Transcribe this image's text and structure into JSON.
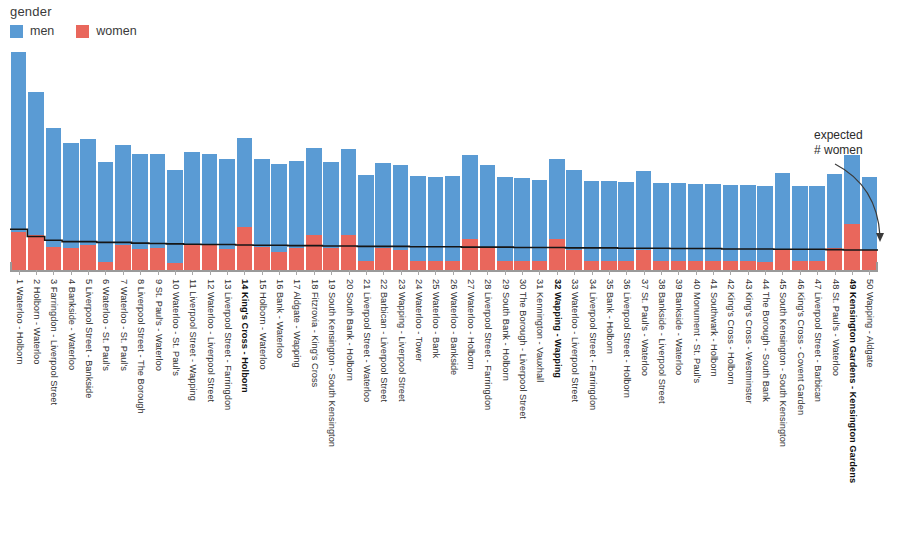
{
  "legend": {
    "title": "gender",
    "entries": [
      {
        "label": "men",
        "color": "#5a9bd4"
      },
      {
        "label": "women",
        "color": "#e9675c"
      }
    ]
  },
  "annotation": {
    "line1": "expected",
    "line2": "# women"
  },
  "chart_data": {
    "type": "bar",
    "subtype": "stacked-bar-with-step-line",
    "title": "",
    "xlabel": "",
    "ylabel": "",
    "grid": false,
    "legend_position": "top-left",
    "legend_title": "gender",
    "series": [
      {
        "name": "men",
        "color": "#5a9bd4",
        "values": [
          560,
          395,
          330,
          290,
          290,
          275,
          275,
          262,
          258,
          255,
          252,
          250,
          248,
          245,
          243,
          242,
          240,
          240,
          238,
          237,
          236,
          235,
          234,
          233,
          233,
          232,
          231,
          230,
          229,
          228,
          222,
          221,
          220,
          219,
          218,
          217,
          216,
          215,
          214,
          213,
          212,
          211,
          210,
          209,
          208,
          207,
          206,
          205,
          188,
          200
        ]
      },
      {
        "name": "women",
        "color": "#e9675c",
        "values": [
          120,
          96,
          62,
          60,
          70,
          22,
          68,
          58,
          60,
          20,
          72,
          70,
          58,
          118,
          62,
          50,
          60,
          95,
          60,
          95,
          26,
          60,
          56,
          26,
          24,
          26,
          85,
          60,
          26,
          25,
          26,
          84,
          56,
          25,
          26,
          24,
          56,
          25,
          26,
          24,
          25,
          24,
          24,
          23,
          58,
          25,
          24,
          60,
          128,
          55
        ]
      }
    ],
    "expected_women_line": {
      "name": "expected # women",
      "color": "#161616",
      "type": "step",
      "values": [
        112,
        92,
        82,
        78,
        78,
        76,
        76,
        74,
        73,
        72,
        71,
        70,
        70,
        69,
        68,
        68,
        67,
        67,
        66,
        66,
        65,
        65,
        65,
        64,
        64,
        64,
        63,
        63,
        63,
        62,
        62,
        62,
        61,
        61,
        61,
        60,
        60,
        60,
        59,
        59,
        59,
        58,
        58,
        58,
        57,
        57,
        57,
        56,
        55,
        55
      ]
    },
    "ylim": [
      0,
      600
    ],
    "categories": [
      "1 Waterloo - Holborn",
      "2 Holborn - Waterloo",
      "3 Farringdon - Liverpool Street",
      "4 Bankside - Waterloo",
      "5 Liverpool Street - Bankside",
      "6 Waterloo - St. Paul's",
      "7 Waterloo - St. Paul's",
      "8 Liverpool Street - The Borough",
      "9 St. Paul's - Waterloo",
      "10 Waterloo - St. Paul's",
      "11 Liverpool Street - Wapping",
      "12 Waterloo - Liverpool Street",
      "13 Liverpool Street - Farringdon",
      "14 King's Cross - Holborn",
      "15 Holborn - Waterloo",
      "16 Bank - Waterloo",
      "17 Aldgate - Wapping",
      "18 Fitzrovia - King's Cross",
      "19 South Kensington - South Kensington",
      "20 South Bank - Holborn",
      "21 Liverpool Street - Waterloo",
      "22 Barbican - Liverpool Street",
      "23 Wapping - Liverpool Street",
      "24 Waterloo - Tower",
      "25 Waterloo - Bank",
      "26 Waterloo - Bankside",
      "27 Waterloo - Holborn",
      "28 Liverpool Street - Farringdon",
      "29 South Bank - Holborn",
      "30 The Borough - Liverpool Street",
      "31 Kennington - Vauxhall",
      "32 Wapping - Wapping",
      "33 Waterloo - Liverpool Street",
      "34 Liverpool Street - Farringdon",
      "35 Bank - Holborn",
      "36 Liverpool Street - Holborn",
      "37 St. Paul's - Waterloo",
      "38 Bankside - Liverpool Street",
      "39 Bankside - Waterloo",
      "40 Monument - St. Paul's",
      "41 Southwark - Holborn",
      "42 King's Cross - Holborn",
      "43 King's Cross - Westminster",
      "44 The Borough - South Bank",
      "45 South Kensington - South Kensington",
      "46 King's Cross - Covent Garden",
      "47 Liverpool Street - Barbican",
      "48 St. Paul's - Waterloo",
      "49 Kensington Gardens - Kensington Gardens",
      "50 Wapping - Aldgate"
    ],
    "highlighted_categories": [
      "14 King's Cross - Holborn",
      "32 Wapping - Wapping",
      "49 Kensington Gardens - Kensington Gardens"
    ],
    "annotations": [
      {
        "text": "expected # women",
        "points_to": "end of step line"
      }
    ]
  }
}
